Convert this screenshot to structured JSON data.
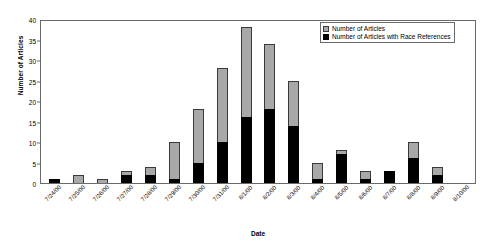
{
  "chart_data": {
    "type": "bar",
    "subtype": "stacked-column",
    "title": "",
    "xlabel": "Date",
    "ylabel": "Number of Articles",
    "ylim": [
      0,
      40
    ],
    "ytick_step": 5,
    "yticks": [
      0,
      5,
      10,
      15,
      20,
      25,
      30,
      35,
      40
    ],
    "grid": false,
    "legend_position": "top-right",
    "categories": [
      "7/24/00",
      "7/25/00",
      "7/26/00",
      "7/27/00",
      "7/28/00",
      "7/29/00",
      "7/30/00",
      "7/31/00",
      "8/1/00",
      "8/2/00",
      "8/3/00",
      "8/4/00",
      "8/5/00",
      "8/6/00",
      "8/7/00",
      "8/8/00",
      "8/9/00",
      "8/10/00"
    ],
    "series": [
      {
        "name": "Number of Articles",
        "color": "#a8a8a8",
        "values": [
          1,
          2,
          1,
          3,
          4,
          10,
          18,
          28,
          38,
          34,
          25,
          5,
          8,
          3,
          3,
          10,
          4,
          0
        ]
      },
      {
        "name": "Number of Articles with Race References",
        "color": "#000000",
        "values": [
          1,
          0,
          0,
          2,
          2,
          1,
          5,
          10,
          16,
          18,
          14,
          1,
          7,
          1,
          3,
          6,
          2,
          0
        ]
      }
    ],
    "stacks": [
      {
        "category": "7/24/00",
        "total": 1,
        "race": 1
      },
      {
        "category": "7/25/00",
        "total": 2,
        "race": 0
      },
      {
        "category": "7/26/00",
        "total": 1,
        "race": 0
      },
      {
        "category": "7/27/00",
        "total": 3,
        "race": 2
      },
      {
        "category": "7/28/00",
        "total": 4,
        "race": 2
      },
      {
        "category": "7/29/00",
        "total": 10,
        "race": 1
      },
      {
        "category": "7/30/00",
        "total": 18,
        "race": 5
      },
      {
        "category": "7/31/00",
        "total": 28,
        "race": 10
      },
      {
        "category": "8/1/00",
        "total": 38,
        "race": 16
      },
      {
        "category": "8/2/00",
        "total": 34,
        "race": 18
      },
      {
        "category": "8/3/00",
        "total": 25,
        "race": 14
      },
      {
        "category": "8/4/00",
        "total": 5,
        "race": 1
      },
      {
        "category": "8/5/00",
        "total": 8,
        "race": 7
      },
      {
        "category": "8/6/00",
        "total": 3,
        "race": 1
      },
      {
        "category": "8/7/00",
        "total": 3,
        "race": 3
      },
      {
        "category": "8/8/00",
        "total": 10,
        "race": 6
      },
      {
        "category": "8/9/00",
        "total": 4,
        "race": 2
      },
      {
        "category": "8/10/00",
        "total": 0,
        "race": 0
      }
    ],
    "legend": [
      {
        "label": "Number of Articles",
        "swatch": "total"
      },
      {
        "label": "Number of Articles with Race References",
        "swatch": "race"
      }
    ]
  }
}
